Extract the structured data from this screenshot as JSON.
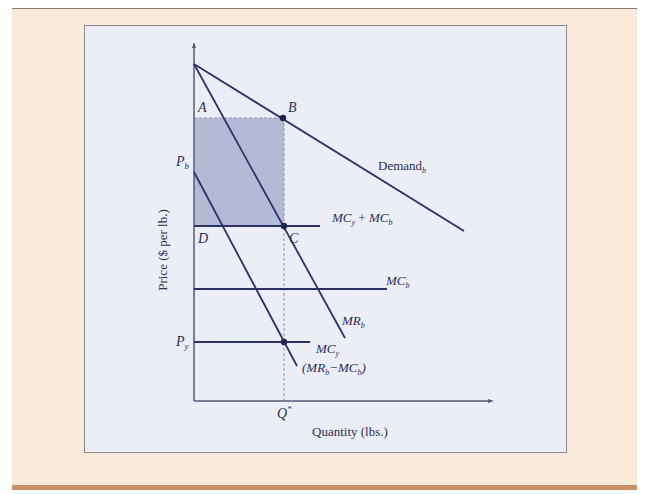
{
  "figure": {
    "y_axis_label": "Price ($ per lb.)",
    "x_axis_label": "Quantity (lbs.)",
    "colors": {
      "outer_panel": "#f8e9d9",
      "bottom_bar": "#c98f66",
      "inner_panel": "#eceef7",
      "line": "#2b3266",
      "shaded_area": "#b4b9d6"
    }
  },
  "points": {
    "A": "A",
    "B": "B",
    "C": "C",
    "D": "D"
  },
  "axis_labels": {
    "Pb_main": "P",
    "Pb_sub": "b",
    "Py_main": "P",
    "Py_sub": "y",
    "Qstar_main": "Q",
    "Qstar_sup": "*"
  },
  "curves": {
    "demand": {
      "main": "Demand",
      "sub": "b"
    },
    "mc_sum": {
      "a_main": "MC",
      "a_sub": "y",
      "plus": " + ",
      "b_main": "MC",
      "b_sub": "b"
    },
    "mc_b": {
      "main": "MC",
      "sub": "b"
    },
    "mr_b": {
      "main": "MR",
      "sub": "b"
    },
    "mc_y": {
      "main": "MC",
      "sub": "y"
    },
    "mr_minus_mc": {
      "open": "(",
      "a_main": "MR",
      "a_sub": "b",
      "minus": "−",
      "b_main": "MC",
      "b_sub": "b",
      "close": ")"
    }
  }
}
